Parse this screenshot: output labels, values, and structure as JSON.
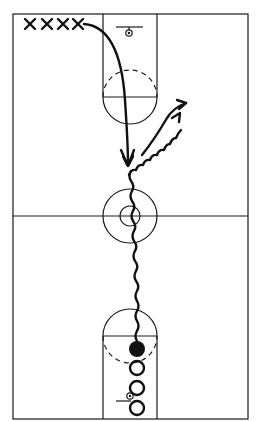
{
  "diagram": {
    "type": "basketball-half-court-drill",
    "colors": {
      "ink": "#111111",
      "background": "#ffffff"
    },
    "court": {
      "boundary": {
        "x": 13,
        "y": 14,
        "width": 235,
        "height": 405
      },
      "midcourt_y": 216,
      "center_circle": {
        "cx": 130,
        "cy": 216,
        "r_outer": 27,
        "r_inner": 10
      },
      "top_key": {
        "lane_left": 103,
        "lane_right": 157,
        "free_throw_y": 97,
        "arc_r": 27,
        "basket": {
          "cx": 129,
          "cy": 33
        },
        "backboard": {
          "x1": 116,
          "x2": 143,
          "y": 27
        }
      },
      "bottom_key": {
        "lane_left": 103,
        "lane_right": 157,
        "free_throw_y": 336,
        "arc_r": 27,
        "basket": {
          "cx": 130,
          "cy": 397
        },
        "backboard": {
          "x1": 116,
          "x2": 131,
          "y": 401
        }
      }
    },
    "players_x": [
      {
        "label": "X",
        "x": 30,
        "y": 24
      },
      {
        "label": "X",
        "x": 48,
        "y": 24
      },
      {
        "label": "X",
        "x": 66,
        "y": 24
      },
      {
        "label": "X",
        "x": 80,
        "y": 24
      }
    ],
    "players_o": [
      {
        "role": "ball-handler",
        "filled": true,
        "cx": 137,
        "cy": 349,
        "r": 8
      },
      {
        "role": "waiting",
        "filled": false,
        "cx": 137,
        "cy": 368,
        "r": 7
      },
      {
        "role": "waiting",
        "filled": false,
        "cx": 137,
        "cy": 388,
        "r": 7
      },
      {
        "role": "waiting",
        "filled": false,
        "cx": 137,
        "cy": 408,
        "r": 7
      }
    ],
    "movements": [
      {
        "type": "pass-cut",
        "style": "solid-curve-arrow",
        "from": [
          85,
          24
        ],
        "to": [
          128,
          165
        ]
      },
      {
        "type": "dribble",
        "style": "wavy",
        "from": [
          137,
          340
        ],
        "to": [
          128,
          175
        ]
      },
      {
        "type": "dribble",
        "style": "wavy-arrow",
        "from": [
          128,
          175
        ],
        "to": [
          182,
          110
        ]
      },
      {
        "type": "cut",
        "style": "solid-arrow",
        "from": [
          144,
          150
        ],
        "to": [
          186,
          103
        ]
      }
    ]
  }
}
